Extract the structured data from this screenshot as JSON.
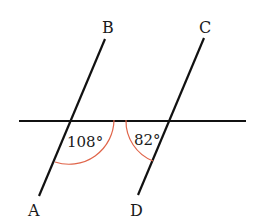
{
  "diagram": {
    "type": "parallel-lines-transversal",
    "points": {
      "A": "A",
      "B": "B",
      "C": "C",
      "D": "D"
    },
    "angles": {
      "left": "108°",
      "right": "82°"
    },
    "colors": {
      "line": "#111111",
      "arc": "#e0654a",
      "text": "#1a1a1a"
    }
  }
}
